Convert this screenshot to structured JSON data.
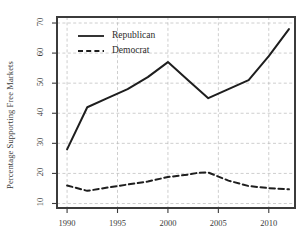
{
  "chart_data": {
    "type": "line",
    "title": "",
    "subtitle": "",
    "xlabel": "",
    "ylabel": "Percentage Supporting Free Markets",
    "xlim": [
      1989,
      2012.6
    ],
    "ylim": [
      8.5,
      72
    ],
    "xticks": [
      1990,
      1995,
      2000,
      2005,
      2010
    ],
    "xtick_labels": [
      "1990",
      "1995",
      "2000",
      "2005",
      "2010"
    ],
    "yticks": [
      10,
      20,
      30,
      40,
      50,
      60,
      70
    ],
    "ytick_labels": [
      "10",
      "20",
      "30",
      "40",
      "50",
      "60",
      "70"
    ],
    "grid": true,
    "grid_style": "dashed",
    "grid_color": "#b9b9b9",
    "legend_position": "top-left-inside",
    "axis_color": "#3b3b3b",
    "series": [
      {
        "name": "Republican",
        "style": "solid",
        "color": "#1e1e1e",
        "x": [
          1990,
          1992,
          1994,
          1996,
          1998,
          2000,
          2002,
          2004,
          2006,
          2008,
          2010,
          2012
        ],
        "values": [
          28,
          42,
          45,
          48,
          52,
          57,
          51,
          45,
          48,
          51,
          59,
          68
        ]
      },
      {
        "name": "Democrat",
        "style": "dashed",
        "color": "#1e1e1e",
        "x": [
          1990,
          1992,
          1994,
          1996,
          1998,
          2000,
          2002,
          2003,
          2004,
          2006,
          2008,
          2010,
          2012
        ],
        "values": [
          16,
          14.2,
          15.3,
          16.3,
          17.3,
          18.8,
          19.6,
          20.2,
          20.3,
          17.6,
          15.8,
          15.1,
          14.7
        ]
      }
    ],
    "legend": [
      {
        "label": "Republican",
        "style": "solid"
      },
      {
        "label": "Democrat",
        "style": "dashed"
      }
    ]
  },
  "plot_box": {
    "left": 57,
    "right": 295,
    "top": 17,
    "bottom": 208
  }
}
